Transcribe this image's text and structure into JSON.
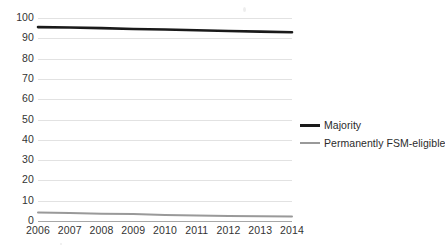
{
  "chart_data": {
    "type": "line",
    "title": "",
    "subtitle": "",
    "xlabel": "",
    "ylabel": "",
    "x": [
      "2006",
      "2007",
      "2008",
      "2009",
      "2010",
      "2011",
      "2012",
      "2013",
      "2014"
    ],
    "categories": [
      "2006",
      "2007",
      "2008",
      "2009",
      "2010",
      "2011",
      "2012",
      "2013",
      "2014"
    ],
    "ylim": [
      0,
      100
    ],
    "y_ticks": [
      "0",
      "10",
      "20",
      "30",
      "40",
      "50",
      "60",
      "70",
      "80",
      "90",
      "100"
    ],
    "y_tick_values": [
      0,
      10,
      20,
      30,
      40,
      50,
      60,
      70,
      80,
      90,
      100
    ],
    "grid": true,
    "legend_position": "right",
    "series": [
      {
        "name": "Majority",
        "color": "#1a1a1a",
        "width": 2.6,
        "values": [
          95.5,
          95.3,
          95.0,
          94.6,
          94.3,
          94.0,
          93.6,
          93.3,
          93.0
        ]
      },
      {
        "name": "Permanently FSM-eligible",
        "color": "#999999",
        "width": 2.0,
        "values": [
          4.2,
          3.9,
          3.6,
          3.4,
          2.9,
          2.7,
          2.5,
          2.3,
          2.2
        ]
      }
    ]
  },
  "legend": {
    "items": [
      {
        "label": "Majority"
      },
      {
        "label": "Permanently FSM-eligible"
      }
    ]
  },
  "colors": {
    "majority": "#1a1a1a",
    "fsm": "#999999",
    "gridline": "#e2e2e2",
    "axis": "#a8a8a8",
    "text": "#333333",
    "background": "#ffffff"
  }
}
